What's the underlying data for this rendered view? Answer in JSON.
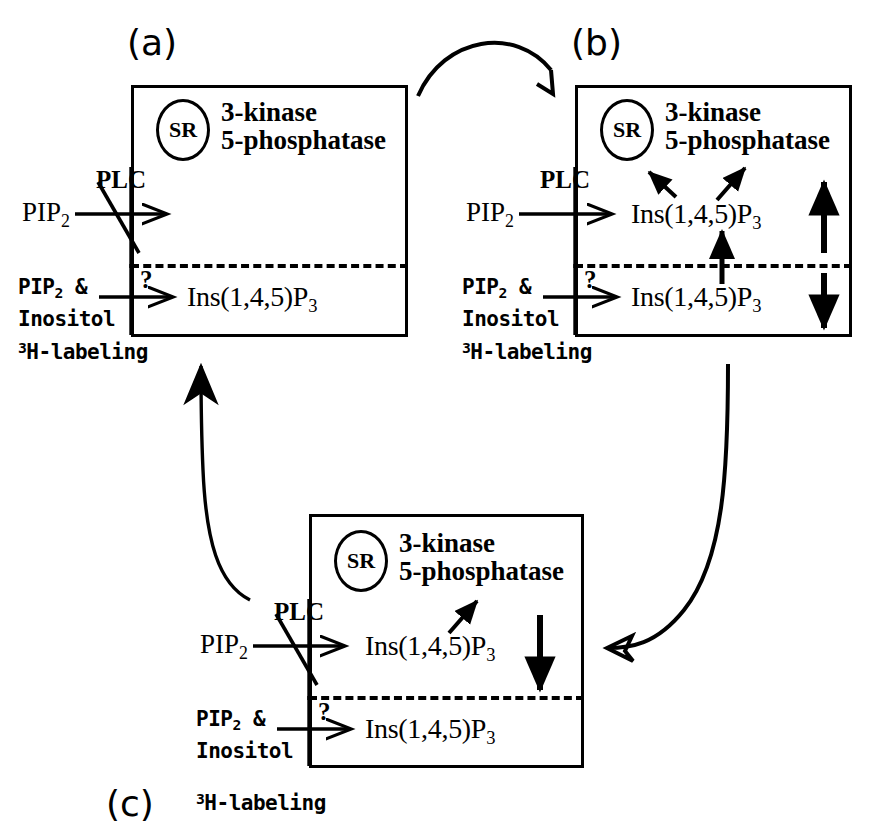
{
  "figure": {
    "panels": [
      {
        "id": "a",
        "label": "(a)",
        "organelle": "SR",
        "enzymes": [
          "3-kinase",
          "5-phosphatase"
        ],
        "upper_substrate": "PIP2",
        "upper_enzyme": "PLC",
        "upper_blocked": true,
        "upper_product": "",
        "upper_change": "",
        "lower_substrate_line1": "PIP2 &",
        "lower_substrate_line2": "Inositol",
        "lower_substrate_line3": "3H-labeling",
        "lower_enzyme": "?",
        "lower_product": "Ins(1,4,5)P3",
        "lower_change": ""
      },
      {
        "id": "b",
        "label": "(b)",
        "organelle": "SR",
        "enzymes": [
          "3-kinase",
          "5-phosphatase"
        ],
        "upper_substrate": "PIP2",
        "upper_enzyme": "PLC",
        "upper_blocked": false,
        "upper_product": "Ins(1,4,5)P3",
        "upper_change": "increase",
        "lower_substrate_line1": "PIP2 &",
        "lower_substrate_line2": "Inositol",
        "lower_substrate_line3": "3H-labeling",
        "lower_enzyme": "?",
        "lower_product": "Ins(1,4,5)P3",
        "lower_change": "decrease"
      },
      {
        "id": "c",
        "label": "(c)",
        "organelle": "SR",
        "enzymes": [
          "3-kinase",
          "5-phosphatase"
        ],
        "upper_substrate": "PIP2",
        "upper_enzyme": "PLC",
        "upper_blocked": true,
        "upper_product": "Ins(1,4,5)P3",
        "upper_change": "decrease",
        "lower_substrate_line1": "PIP2 &",
        "lower_substrate_line2": "Inositol",
        "lower_substrate_line3": "3H-labeling",
        "lower_enzyme": "?",
        "lower_product": "Ins(1,4,5)P3",
        "lower_change": ""
      }
    ],
    "flow_arrows": [
      {
        "name": "a-to-b",
        "from": "a",
        "to": "b",
        "shape": "arc-over-top"
      },
      {
        "name": "b-to-c",
        "from": "b",
        "to": "c",
        "shape": "curve-right-down"
      },
      {
        "name": "c-to-a",
        "from": "c",
        "to": "a",
        "shape": "curve-left-up"
      }
    ],
    "colors": {
      "ink": "#000000",
      "background": "#ffffff"
    }
  },
  "panel_a": {
    "label": "(a)",
    "sr": "SR",
    "enzyme1": "3-kinase",
    "enzyme2": "5-phosphatase",
    "plc": "PLC",
    "pip2": "PIP",
    "pip2_sub": "2",
    "question": "?",
    "pip2_and": "PIP",
    "pip2_and_sub": "2",
    "pip2_and_tail": " &",
    "inositol": "Inositol",
    "h_sup": "3",
    "h_label": "H-labeling",
    "lower_product": "Ins(1,4,5)P",
    "lower_product_sub": "3"
  },
  "panel_b": {
    "label": "(b)",
    "sr": "SR",
    "enzyme1": "3-kinase",
    "enzyme2": "5-phosphatase",
    "plc": "PLC",
    "pip2": "PIP",
    "pip2_sub": "2",
    "question": "?",
    "pip2_and": "PIP",
    "pip2_and_sub": "2",
    "pip2_and_tail": " &",
    "inositol": "Inositol",
    "h_sup": "3",
    "h_label": "H-labeling",
    "upper_product": "Ins(1,4,5)P",
    "upper_product_sub": "3",
    "lower_product": "Ins(1,4,5)P",
    "lower_product_sub": "3"
  },
  "panel_c": {
    "label": "(c)",
    "sr": "SR",
    "enzyme1": "3-kinase",
    "enzyme2": "5-phosphatase",
    "plc": "PLC",
    "pip2": "PIP",
    "pip2_sub": "2",
    "question": "?",
    "pip2_and": "PIP",
    "pip2_and_sub": "2",
    "pip2_and_tail": " &",
    "inositol": "Inositol",
    "h_sup": "3",
    "h_label": "H-labeling",
    "upper_product": "Ins(1,4,5)P",
    "upper_product_sub": "3",
    "lower_product": "Ins(1,4,5)P",
    "lower_product_sub": "3"
  }
}
